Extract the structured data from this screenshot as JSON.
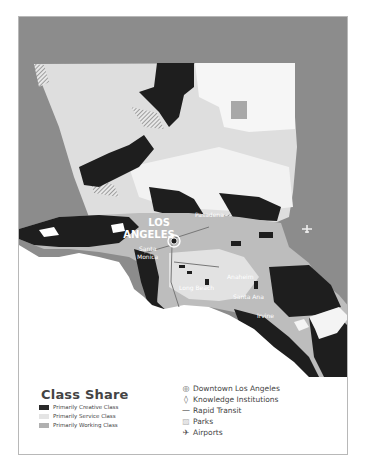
{
  "map": {
    "colors": {
      "outside_land": "#8c8c8c",
      "ocean": "#ffffff",
      "creative": "#1e1e1e",
      "service": "#e2e2e2",
      "working": "#b4b4b4",
      "parks": "#f4f4f4"
    },
    "labels": {
      "los": "LOS",
      "angeles": "ANGELES",
      "pasadena": "Pasadena",
      "santa_monica_1": "Santa",
      "santa_monica_2": "Monica",
      "long_beach": "Long Beach",
      "anaheim": "Anaheim",
      "santa_ana": "Santa Ana",
      "irvine": "Irvine"
    }
  },
  "legend": {
    "class_share": {
      "title": "Class Share",
      "items": [
        {
          "label": "Primarily Creative Class",
          "color": "#2a2a2a"
        },
        {
          "label": "Primarily Service Class",
          "color": "#e4e4e4"
        },
        {
          "label": "Primarily Working Class",
          "color": "#b0b0b0"
        }
      ]
    },
    "symbols": {
      "items": [
        {
          "icon": "target-icon",
          "glyph": "◎",
          "label": "Downtown Los Angeles"
        },
        {
          "icon": "knowledge-icon",
          "glyph": "◊",
          "label": "Knowledge Institutions"
        },
        {
          "icon": "transit-line-icon",
          "glyph": "—",
          "label": "Rapid Transit"
        },
        {
          "icon": "parks-hatch-icon",
          "glyph": "▨",
          "label": "Parks"
        },
        {
          "icon": "airplane-icon",
          "glyph": "✈",
          "label": "Airports"
        }
      ]
    }
  }
}
